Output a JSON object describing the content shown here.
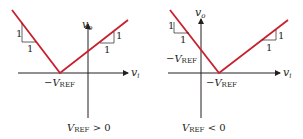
{
  "figures": [
    {
      "id": "left",
      "caption_main": "V",
      "caption_sub": "REF",
      "caption_rel": " > 0",
      "x_axis_label": "v",
      "x_axis_sub": "i",
      "y_axis_label": "v",
      "y_axis_sub": "o",
      "vertex_label_prefix": "−V",
      "vertex_label_sub": "REF",
      "slope_left": {
        "rise": "1",
        "run": "1"
      },
      "slope_right": {
        "rise": "1",
        "run": "1"
      }
    },
    {
      "id": "right",
      "caption_main": "V",
      "caption_sub": "REF",
      "caption_rel": " < 0",
      "x_axis_label": "v",
      "x_axis_sub": "i",
      "y_axis_label": "v",
      "y_axis_sub": "o",
      "vertex_label_prefix": "−V",
      "vertex_label_sub": "REF",
      "intercept_label_prefix": "−V",
      "intercept_label_sub": "REF",
      "slope_left": {
        "rise": "1",
        "run": "1"
      },
      "slope_right": {
        "rise": "1",
        "run": "1"
      }
    }
  ],
  "colors": {
    "curve": "#c8202e",
    "axis": "#231f20"
  }
}
